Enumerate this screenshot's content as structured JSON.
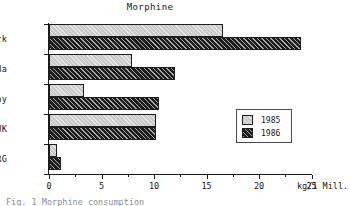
{
  "chart_data": {
    "type": "bar",
    "orientation": "horizontal",
    "title": "Morphine",
    "xlabel": "kg/1 Mill.",
    "ylabel": "",
    "categories": [
      "Denmark",
      "Canada",
      "Norway",
      "UK",
      "FRG"
    ],
    "series": [
      {
        "name": "1985",
        "values": [
          16.6,
          7.9,
          3.3,
          10.2,
          0.8
        ],
        "color": "#c9c9c9"
      },
      {
        "name": "1986",
        "values": [
          24.0,
          12.0,
          10.5,
          10.2,
          1.1
        ],
        "color": "#1c1c1c"
      }
    ],
    "xlim": [
      0,
      25
    ],
    "xticks": [
      0,
      5,
      10,
      15,
      20,
      25
    ],
    "xtick_labels": [
      "0",
      "5",
      "10",
      "15",
      "20",
      "25"
    ],
    "minor_xticks": [
      2.5,
      7.5,
      12.5,
      17.5,
      22.5
    ],
    "grid": false,
    "legend_position": "center-right",
    "unit": "kg/1 Mill."
  },
  "legend": {
    "entries": [
      {
        "label": "1985"
      },
      {
        "label": "1986"
      }
    ]
  },
  "caption": {
    "text": "Fig. 1  Morphine consumption"
  }
}
